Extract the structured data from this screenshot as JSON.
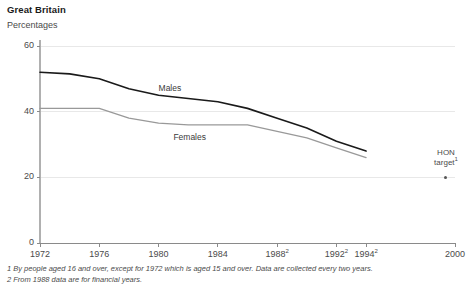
{
  "header": {
    "title": "Great Britain",
    "subtitle": "Percentages"
  },
  "annotation": {
    "line1": "HON",
    "line2": "target",
    "superscript": "1",
    "marker": "target-dot"
  },
  "footnotes": [
    "1 By people aged 16 and over, except for 1972 which is aged 15 and over. Data are collected every two years.",
    "2 From 1988 data are for financial years."
  ],
  "chart_data": {
    "type": "line",
    "title": "Great Britain",
    "subtitle": "Percentages",
    "xlabel": "",
    "ylabel": "Percentages",
    "ylim": [
      0,
      60
    ],
    "yticks": [
      0,
      20,
      40,
      60
    ],
    "xlim": [
      1972,
      2000
    ],
    "xticks": [
      1972,
      1976,
      1980,
      1984,
      1988,
      1992,
      1994,
      2000
    ],
    "xtick_labels": [
      "1972",
      "1976",
      "1980",
      "1984",
      "1988",
      "1992",
      "1994",
      "2000"
    ],
    "xtick_superscripts": [
      "",
      "",
      "",
      "",
      "2",
      "2",
      "2",
      ""
    ],
    "grid": true,
    "legend": "inline-labels",
    "series": [
      {
        "name": "Males",
        "color": "#1a1a1a",
        "label_x": 1980,
        "label_y": 47,
        "x": [
          1972,
          1974,
          1976,
          1978,
          1980,
          1982,
          1984,
          1986,
          1988,
          1990,
          1992,
          1994
        ],
        "values": [
          52,
          51.5,
          50,
          47,
          45,
          44,
          43,
          41,
          38,
          35,
          31,
          28
        ]
      },
      {
        "name": "Females",
        "color": "#999999",
        "label_x": 1981,
        "label_y": 32,
        "x": [
          1972,
          1974,
          1976,
          1978,
          1980,
          1982,
          1984,
          1986,
          1988,
          1990,
          1992,
          1994
        ],
        "values": [
          41,
          41,
          41,
          38,
          36.5,
          36,
          36,
          36,
          34,
          32,
          29,
          26
        ]
      }
    ],
    "annotations": [
      {
        "name": "HON target",
        "superscript": "1",
        "x": 2000,
        "y": 20,
        "marker": "dot"
      }
    ]
  }
}
